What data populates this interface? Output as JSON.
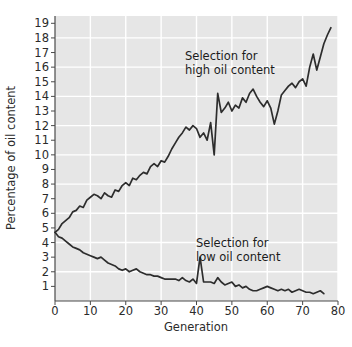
{
  "chart_data": {
    "type": "line",
    "title": "",
    "xlabel": "Generation",
    "ylabel": "Percentage of oil content",
    "xlim": [
      0,
      80
    ],
    "ylim": [
      0,
      19.5
    ],
    "xticks": [
      0,
      10,
      20,
      30,
      40,
      50,
      60,
      70,
      80
    ],
    "xtick_labels": [
      "0",
      "10",
      "20",
      "30",
      "40",
      "50",
      "60",
      "70",
      "80"
    ],
    "yticks": [
      1,
      2,
      3,
      4,
      5,
      6,
      7,
      8,
      9,
      10,
      11,
      12,
      13,
      14,
      15,
      16,
      17,
      18,
      19
    ],
    "ytick_labels": [
      "1",
      "2",
      "3",
      "4",
      "5",
      "6",
      "7",
      "8",
      "9",
      "10",
      "11",
      "12",
      "13",
      "14",
      "15",
      "16",
      "17",
      "18",
      "19"
    ],
    "grid": true,
    "grid_color": "#ffffff",
    "plot_background": "#e6e6e6",
    "line_color": "#2d2d2d",
    "legend": "none",
    "annotations": [
      {
        "text_line1": "Selection for",
        "text_line2": "high oil content",
        "x": 40,
        "y": 16.7
      },
      {
        "text_line1": "Selection for",
        "text_line2": "low oil content",
        "x": 44,
        "y": 4.1
      }
    ],
    "series": [
      {
        "name": "Selection for high oil content",
        "x": [
          0,
          1,
          2,
          3,
          4,
          5,
          6,
          7,
          8,
          9,
          10,
          11,
          12,
          13,
          14,
          15,
          16,
          17,
          18,
          19,
          20,
          21,
          22,
          23,
          24,
          25,
          26,
          27,
          28,
          29,
          30,
          31,
          32,
          33,
          34,
          35,
          36,
          37,
          38,
          39,
          40,
          41,
          42,
          43,
          44,
          45,
          46,
          47,
          48,
          49,
          50,
          51,
          52,
          53,
          54,
          55,
          56,
          57,
          58,
          59,
          60,
          61,
          62,
          63,
          64,
          65,
          66,
          67,
          68,
          69,
          70,
          71,
          72,
          73,
          74,
          75,
          76,
          77,
          78
        ],
        "values": [
          4.7,
          4.9,
          5.3,
          5.5,
          5.7,
          6.1,
          6.2,
          6.5,
          6.4,
          6.9,
          7.1,
          7.3,
          7.2,
          7.0,
          7.4,
          7.2,
          7.1,
          7.6,
          7.5,
          7.9,
          8.1,
          7.9,
          8.4,
          8.3,
          8.6,
          8.8,
          8.7,
          9.2,
          9.4,
          9.2,
          9.6,
          9.5,
          9.9,
          10.4,
          10.8,
          11.2,
          11.5,
          11.9,
          11.7,
          12.0,
          11.8,
          11.2,
          11.5,
          11.0,
          12.2,
          10.0,
          14.2,
          12.9,
          13.2,
          13.6,
          13.0,
          13.4,
          13.2,
          13.9,
          13.6,
          14.2,
          14.5,
          14.0,
          13.6,
          13.3,
          13.7,
          13.2,
          12.1,
          13.0,
          14.1,
          14.4,
          14.7,
          14.9,
          14.6,
          15.0,
          15.2,
          14.7,
          16.0,
          16.9,
          15.8,
          16.7,
          17.6,
          18.2,
          18.7
        ]
      },
      {
        "name": "Selection for low oil content",
        "x": [
          0,
          1,
          2,
          3,
          4,
          5,
          6,
          7,
          8,
          9,
          10,
          11,
          12,
          13,
          14,
          15,
          16,
          17,
          18,
          19,
          20,
          21,
          22,
          23,
          24,
          25,
          26,
          27,
          28,
          29,
          30,
          31,
          32,
          33,
          34,
          35,
          36,
          37,
          38,
          39,
          40,
          41,
          42,
          43,
          44,
          45,
          46,
          47,
          48,
          49,
          50,
          51,
          52,
          53,
          54,
          55,
          56,
          57,
          58,
          59,
          60,
          61,
          62,
          63,
          64,
          65,
          66,
          67,
          68,
          69,
          70,
          71,
          72,
          73,
          74,
          75,
          76
        ],
        "values": [
          4.7,
          4.4,
          4.3,
          4.1,
          3.9,
          3.7,
          3.6,
          3.5,
          3.3,
          3.2,
          3.1,
          3.0,
          2.9,
          3.0,
          2.8,
          2.6,
          2.5,
          2.4,
          2.2,
          2.1,
          2.2,
          2.0,
          2.1,
          2.2,
          2.0,
          1.9,
          1.8,
          1.8,
          1.7,
          1.7,
          1.6,
          1.5,
          1.5,
          1.5,
          1.5,
          1.4,
          1.6,
          1.4,
          1.3,
          1.5,
          1.2,
          3.0,
          1.3,
          1.3,
          1.3,
          1.2,
          1.6,
          1.3,
          1.1,
          1.2,
          1.3,
          1.0,
          1.1,
          0.9,
          1.0,
          0.8,
          0.7,
          0.7,
          0.8,
          0.9,
          1.0,
          0.9,
          0.8,
          0.7,
          0.8,
          0.7,
          0.8,
          0.6,
          0.7,
          0.8,
          0.7,
          0.6,
          0.6,
          0.5,
          0.6,
          0.7,
          0.5
        ]
      }
    ]
  },
  "axis": {
    "xlabel": "Generation",
    "ylabel": "Percentage of oil content"
  },
  "annotation_high": {
    "line1": "Selection for",
    "line2": "high oil content"
  },
  "annotation_low": {
    "line1": "Selection for",
    "line2": "low oil content"
  }
}
